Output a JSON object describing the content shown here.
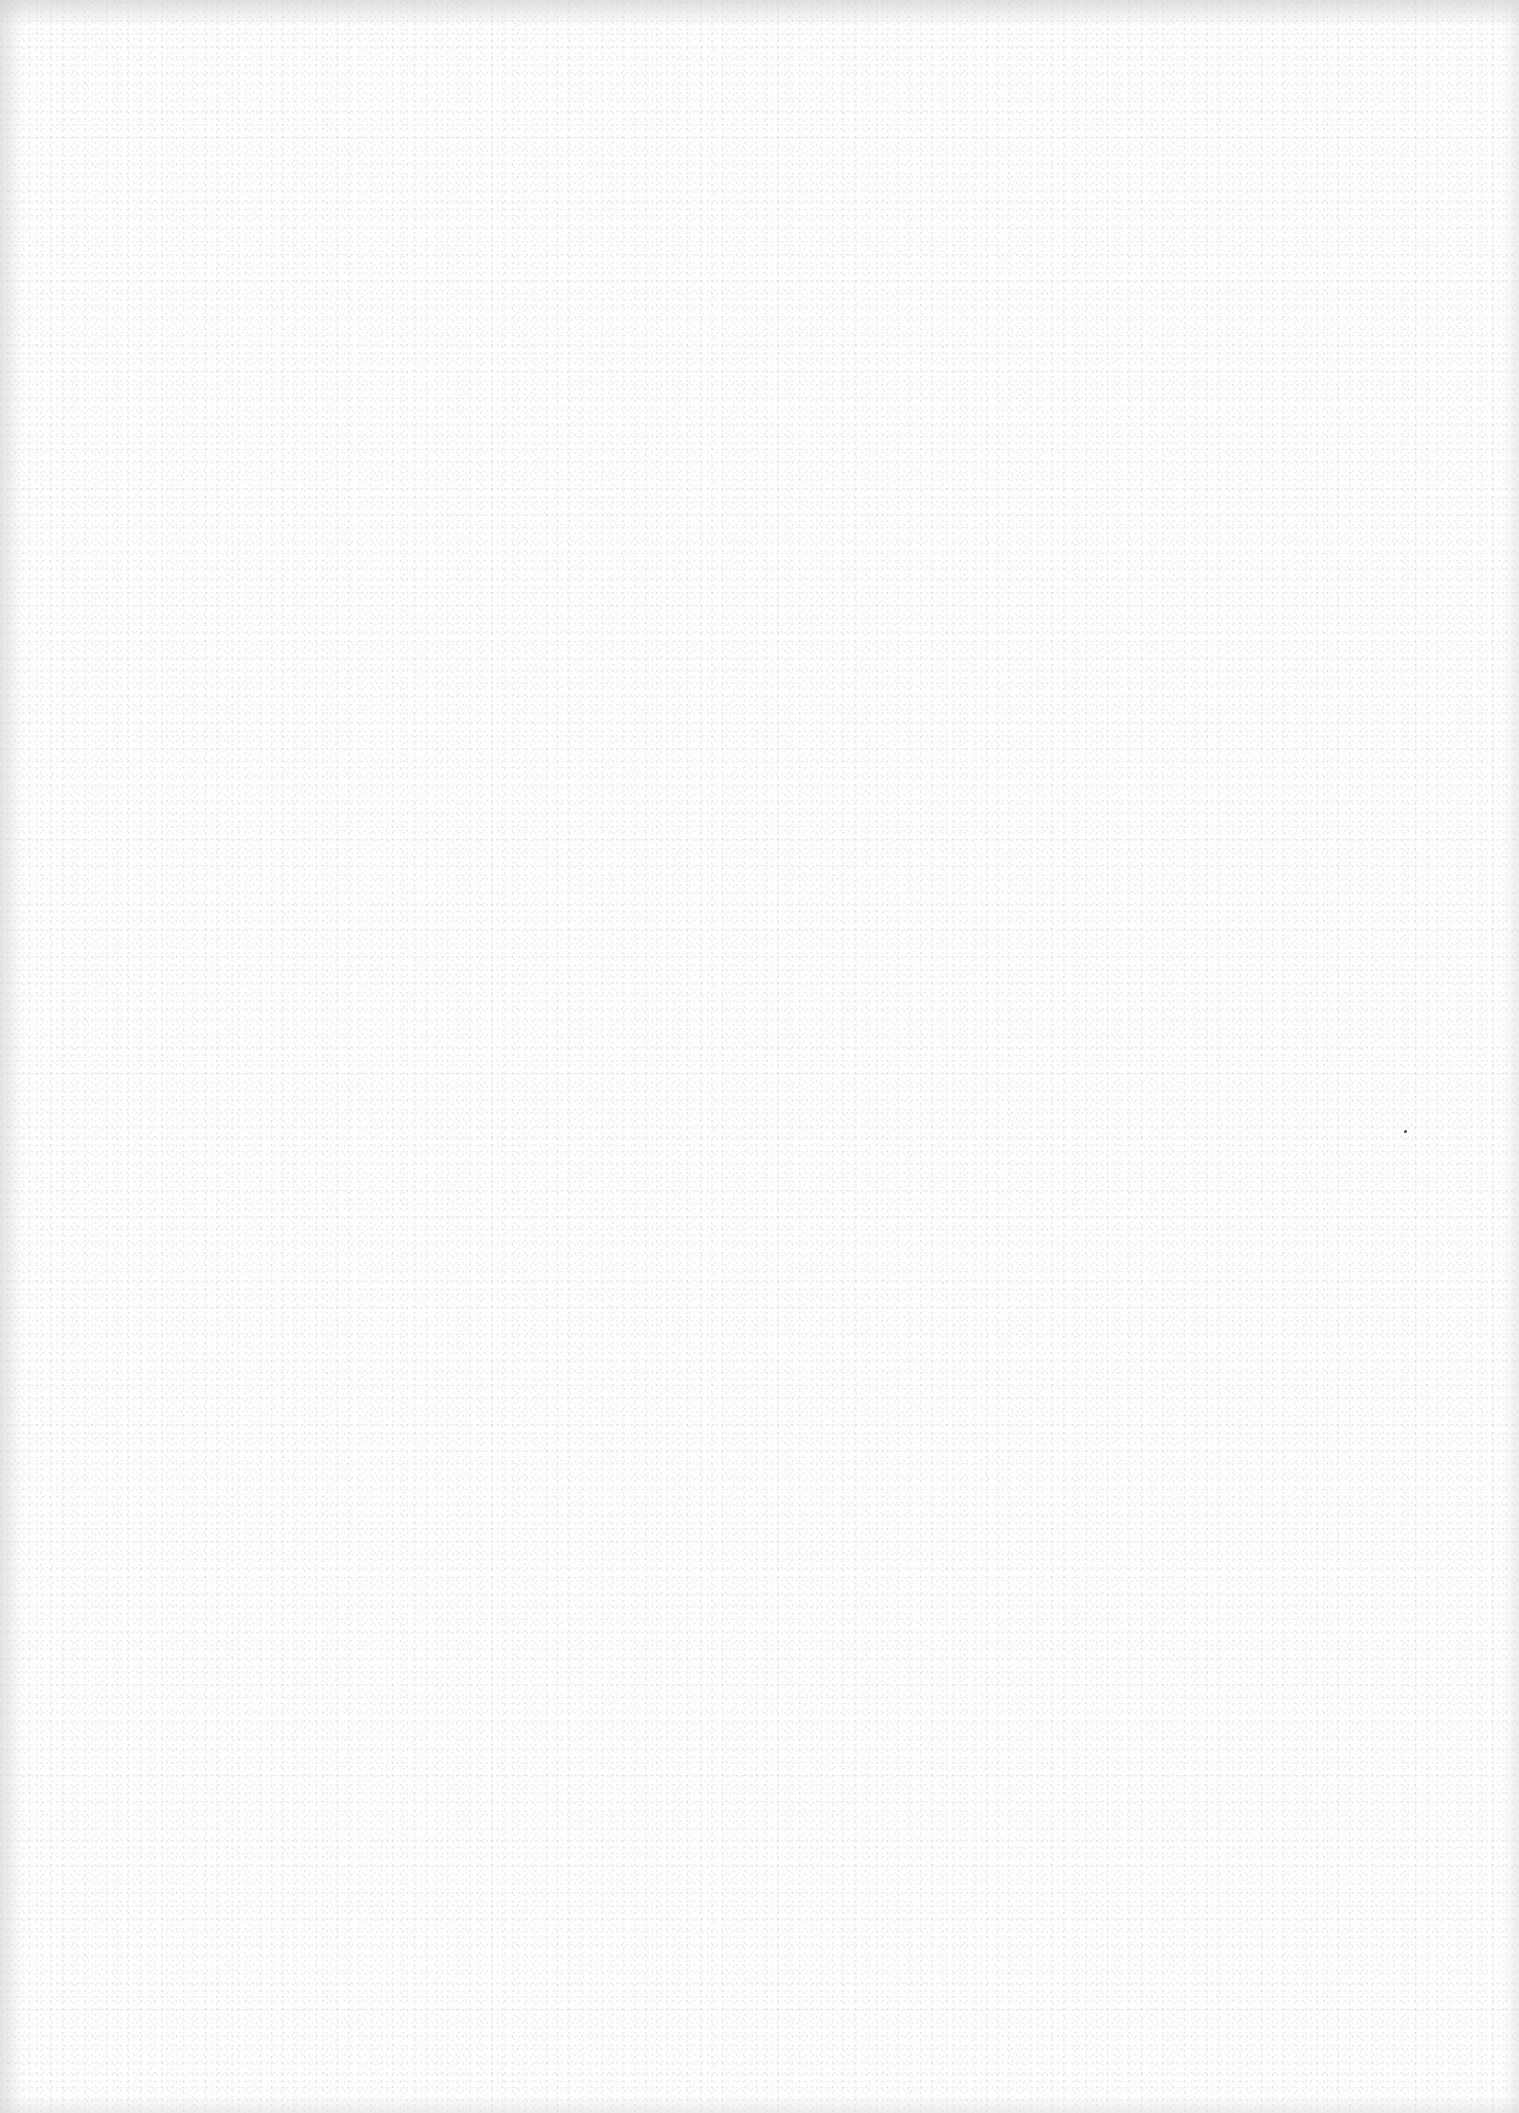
{
  "page": {
    "type": "blank scanned page",
    "background_color": "#fdfdfd",
    "edge_shade_color": "#c8c8c8",
    "speckle_color": "#969696",
    "text_content": []
  },
  "artifacts": [
    {
      "kind": "dust-speck",
      "x": 1405,
      "y": 1131,
      "color": "#4a4a4a"
    }
  ]
}
